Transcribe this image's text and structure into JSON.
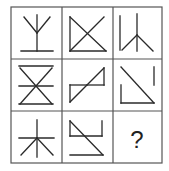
{
  "puzzle": {
    "rows": 3,
    "cols": 3,
    "line_color": "#2a2a2a",
    "grid_color": "#555555",
    "cells": [
      {
        "id": "r1c1",
        "description": "Y shape: two diagonals meeting at center, vertical stem down to a horizontal base line"
      },
      {
        "id": "r1c2",
        "description": "Left vertical line, bottom horizontal line and X formed by two diagonals"
      },
      {
        "id": "r1c3",
        "description": "Two vertical lines with inverted V fanning from top of right line"
      },
      {
        "id": "r2c1",
        "description": "Top horizontal line, X crossing at center with horizontal line, bottom horizontal line"
      },
      {
        "id": "r2c2",
        "description": "Diagonal rising line with a rectangle-like Z: left vertical + top-left horizontal, right vertical"
      },
      {
        "id": "r2c3",
        "description": "Diagonal from top-left to bottom-right, left L-corner at bottom, short vertical at top right"
      },
      {
        "id": "r3c1",
        "description": "Asterisk-like: vertical line, horizontal line, two diagonals downward from center"
      },
      {
        "id": "r3c2",
        "description": "Top horizontal with right vertical hook, diagonal from top-left to bottom-right, bottom horizontal"
      },
      {
        "id": "r3c3",
        "description": "Unknown answer",
        "label": "?"
      }
    ]
  }
}
